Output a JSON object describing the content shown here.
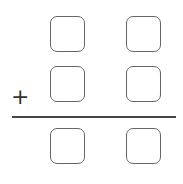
{
  "problem": {
    "operator": "+",
    "rows": [
      {
        "name": "addend-1",
        "digits": [
          "",
          ""
        ]
      },
      {
        "name": "addend-2",
        "digits": [
          "",
          ""
        ]
      },
      {
        "name": "sum",
        "digits": [
          "",
          ""
        ]
      }
    ]
  },
  "colors": {
    "box_border": "#666666",
    "rule": "#444444",
    "operator": "#333333"
  }
}
